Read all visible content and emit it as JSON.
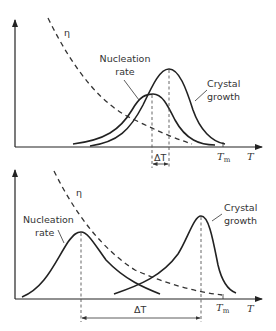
{
  "diagram": {
    "top_panel": {
      "labels": {
        "viscosity": "η",
        "nucleation_line1": "Nucleation",
        "nucleation_line2": "rate",
        "growth_line1": "Crystal",
        "growth_line2": "growth",
        "delta_t": "ΔT",
        "tm_main": "T",
        "tm_sub": "m",
        "x_axis": "T"
      }
    },
    "bottom_panel": {
      "labels": {
        "viscosity": "η",
        "nucleation_line1": "Nucleation",
        "nucleation_line2": "rate",
        "growth_line1": "Crystal",
        "growth_line2": "growth",
        "delta_t": "ΔT",
        "tm_main": "T",
        "tm_sub": "m",
        "x_axis": "T"
      }
    },
    "colors": {
      "line": "#222222",
      "text": "#333333",
      "background": "#ffffff"
    }
  }
}
